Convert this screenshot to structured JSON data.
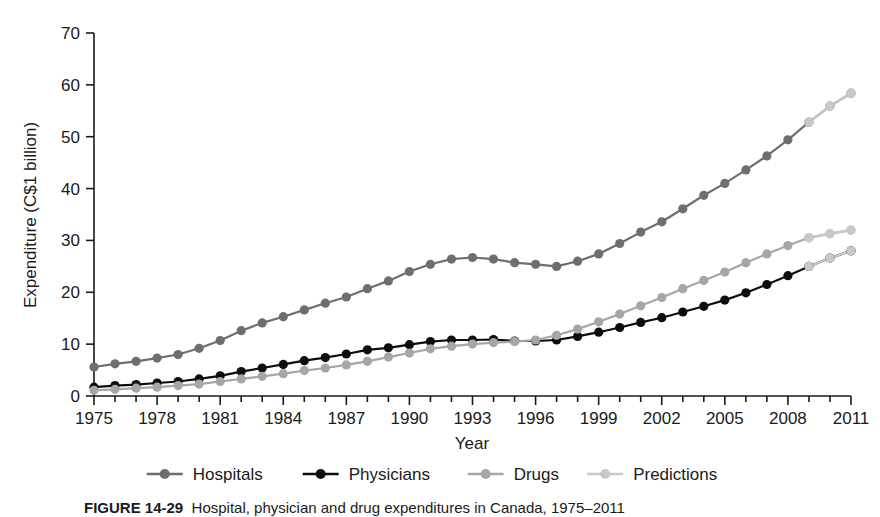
{
  "figure": {
    "caption_label": "FIGURE 14-29",
    "caption_text": "Hospital, physician and drug expenditures in Canada, 1975–2011"
  },
  "chart_data": {
    "type": "line",
    "title": "",
    "xlabel": "Year",
    "ylabel": "Expenditure (C$1 billion)",
    "xlim": [
      1975,
      2011
    ],
    "ylim": [
      0,
      70
    ],
    "ytick_values": [
      0,
      10,
      20,
      30,
      40,
      50,
      60,
      70
    ],
    "ytick_labels": [
      "0",
      "10",
      "20",
      "30",
      "40",
      "50",
      "60",
      "70"
    ],
    "xtick_values": [
      1975,
      1978,
      1981,
      1984,
      1987,
      1990,
      1993,
      1996,
      1999,
      2002,
      2005,
      2008,
      2011
    ],
    "xtick_labels": [
      "1975",
      "1978",
      "1981",
      "1984",
      "1987",
      "1990",
      "1993",
      "1996",
      "1999",
      "2002",
      "2005",
      "2008",
      "2011"
    ],
    "grid": false,
    "legend_position": "bottom",
    "colors": {
      "hospitals": "#6e6e6e",
      "physicians": "#0d0d0d",
      "drugs": "#a6a6a6",
      "predictions": "#c9c9c9"
    },
    "x": [
      1975,
      1976,
      1977,
      1978,
      1979,
      1980,
      1981,
      1982,
      1983,
      1984,
      1985,
      1986,
      1987,
      1988,
      1989,
      1990,
      1991,
      1992,
      1993,
      1994,
      1995,
      1996,
      1997,
      1998,
      1999,
      2000,
      2001,
      2002,
      2003,
      2004,
      2005,
      2006,
      2007,
      2008,
      2009,
      2010,
      2011
    ],
    "series": [
      {
        "name": "Hospitals",
        "color_key": "hospitals",
        "values": [
          5.6,
          6.2,
          6.7,
          7.3,
          8.0,
          9.2,
          10.7,
          12.6,
          14.1,
          15.3,
          16.6,
          17.9,
          19.1,
          20.7,
          22.2,
          24.0,
          25.4,
          26.4,
          26.7,
          26.4,
          25.7,
          25.4,
          25.0,
          26.0,
          27.4,
          29.4,
          31.6,
          33.6,
          36.1,
          38.7,
          41.0,
          43.6,
          46.3,
          49.4,
          52.8,
          55.9,
          58.4
        ]
      },
      {
        "name": "Physicians",
        "color_key": "physicians",
        "values": [
          1.7,
          2.0,
          2.2,
          2.5,
          2.8,
          3.3,
          3.9,
          4.7,
          5.4,
          6.1,
          6.8,
          7.4,
          8.1,
          8.9,
          9.3,
          9.9,
          10.5,
          10.8,
          10.8,
          10.9,
          10.6,
          10.6,
          10.8,
          11.5,
          12.3,
          13.2,
          14.2,
          15.1,
          16.2,
          17.3,
          18.5,
          19.9,
          21.5,
          23.2,
          25.0,
          26.6,
          28.0
        ]
      },
      {
        "name": "Drugs",
        "color_key": "drugs",
        "values": [
          1.1,
          1.3,
          1.5,
          1.7,
          2.0,
          2.3,
          2.8,
          3.3,
          3.8,
          4.3,
          4.9,
          5.4,
          6.0,
          6.7,
          7.5,
          8.3,
          9.1,
          9.6,
          10.0,
          10.3,
          10.5,
          10.8,
          11.7,
          12.9,
          14.3,
          15.8,
          17.4,
          19.0,
          20.7,
          22.3,
          23.9,
          25.7,
          27.4,
          29.0,
          30.5,
          31.3,
          32.0
        ]
      },
      {
        "name": "Predictions",
        "color_key": "predictions",
        "note": "final projected segment of each series",
        "segments": [
          {
            "for": "Hospitals",
            "x": [
              2009,
              2010,
              2011
            ],
            "values": [
              52.8,
              55.9,
              58.4
            ]
          },
          {
            "for": "Physicians",
            "x": [
              2009,
              2010,
              2011
            ],
            "values": [
              25.0,
              26.6,
              28.0
            ]
          },
          {
            "for": "Drugs",
            "x": [
              2009,
              2010,
              2011
            ],
            "values": [
              30.5,
              31.3,
              32.0
            ]
          }
        ]
      }
    ],
    "legend": [
      {
        "label": "Hospitals",
        "color_key": "hospitals"
      },
      {
        "label": "Physicians",
        "color_key": "physicians"
      },
      {
        "label": "Drugs",
        "color_key": "drugs"
      },
      {
        "label": "Predictions",
        "color_key": "predictions"
      }
    ]
  }
}
